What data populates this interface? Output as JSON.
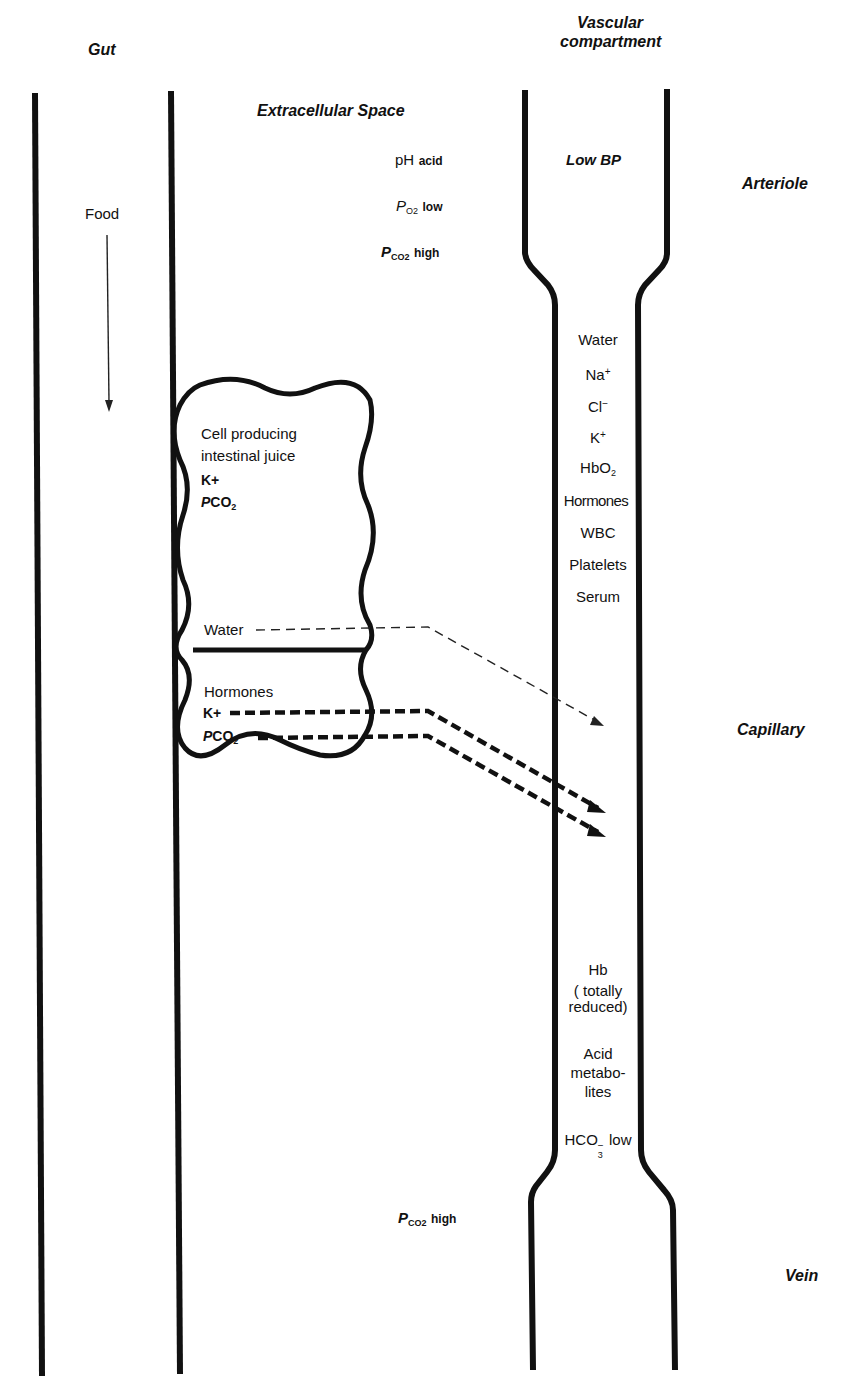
{
  "headers": {
    "gut": "Gut",
    "vascular_line1": "Vascular",
    "vascular_line2": "compartment",
    "extracellular": "Extracellular Space",
    "arteriole": "Arteriole",
    "capillary": "Capillary",
    "vein": "Vein"
  },
  "gut": {
    "food_label": "Food"
  },
  "extracellular_top": {
    "ph_main": "pH",
    "ph_qual": "acid",
    "po2_p": "P",
    "po2_sub": "O2",
    "po2_qual": "low",
    "pco2_p": "P",
    "pco2_sub": "CO2",
    "pco2_qual": "high"
  },
  "extracellular_bottom": {
    "pco2_p": "P",
    "pco2_sub": "CO2",
    "pco2_qual": "high"
  },
  "arteriole": {
    "bp": "Low BP"
  },
  "cell": {
    "title_line1": "Cell producing",
    "title_line2": "intestinal juice",
    "k": "K+",
    "pco2_p": "P",
    "pco2_main": "CO",
    "pco2_sub": "2",
    "water": "Water",
    "hormones": "Hormones",
    "k_lower": "K+",
    "pco2_lower_p": "P",
    "pco2_lower_main": "CO",
    "pco2_lower_sub": "2"
  },
  "capillary_contents": [
    {
      "label": "Water"
    },
    {
      "label": "Na",
      "sup": "+"
    },
    {
      "label": "Cl",
      "sup": "−"
    },
    {
      "label": "K",
      "sup": "+"
    },
    {
      "label": "HbO",
      "sub": "2"
    },
    {
      "label": "Hormones"
    },
    {
      "label": "WBC"
    },
    {
      "label": "Platelets"
    },
    {
      "label": "Serum"
    }
  ],
  "venous_contents": {
    "hb": "Hb",
    "hb_note_1": "( totally",
    "hb_note_2": "reduced)",
    "acid_1": "Acid",
    "acid_2": "metabo-",
    "acid_3": "lites",
    "hco3_main": "HCO",
    "hco3_sub": "3",
    "hco3_sup": "−",
    "hco3_qual": "low"
  },
  "colors": {
    "ink": "#111111",
    "background": "#ffffff"
  }
}
